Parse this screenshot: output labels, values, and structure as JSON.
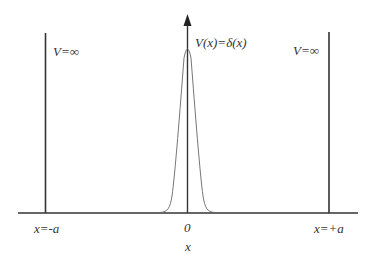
{
  "diagram": {
    "labels": {
      "left_potential": "V=∞",
      "right_potential": "V=∞",
      "delta_potential": "V(x)=δ(x)",
      "left_wall": "x=-a",
      "right_wall": "x=+a",
      "origin": "0",
      "axis": "x"
    },
    "colors": {
      "line": "#333333",
      "curve": "#555555",
      "background": "#ffffff"
    }
  }
}
